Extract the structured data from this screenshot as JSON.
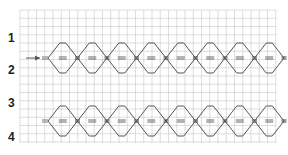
{
  "figure": {
    "row_labels": [
      "1",
      "2",
      "3",
      "4"
    ],
    "strips": [
      {
        "id": "top-strip",
        "diamond_count": 8,
        "has_arrow": true
      },
      {
        "id": "bottom-strip",
        "diamond_count": 8,
        "has_arrow": false
      }
    ],
    "colors": {
      "grid": "#c8c8c8",
      "grid_major": "#b0b0b0",
      "line": "#555555",
      "label": "#222222"
    }
  }
}
